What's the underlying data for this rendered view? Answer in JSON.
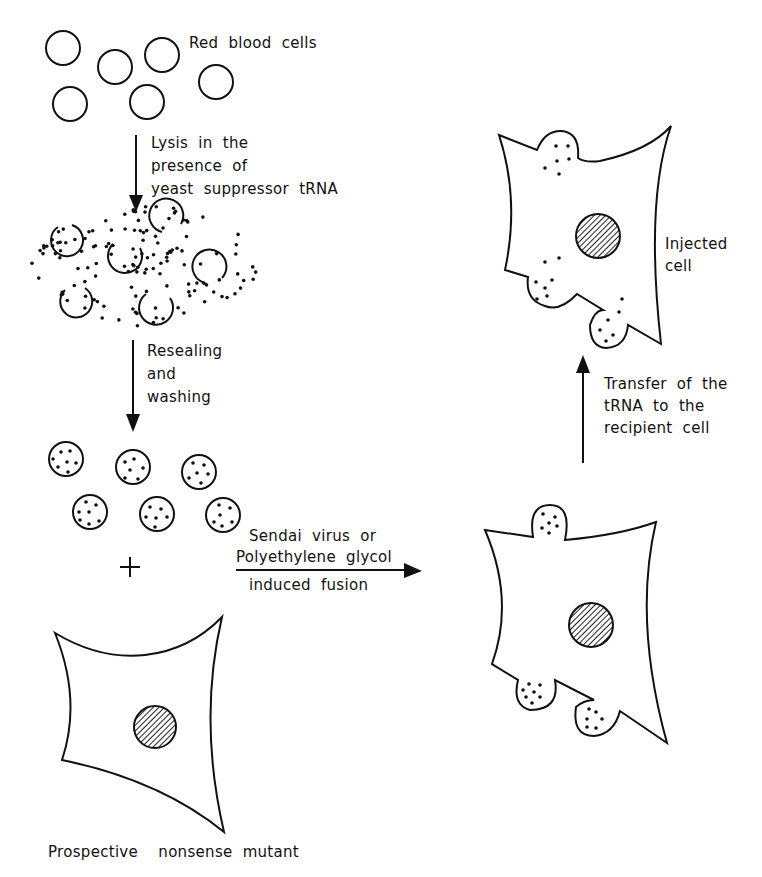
{
  "diagram": {
    "labels": {
      "red_blood_cells": "Red  blood  cells",
      "lysis": [
        "Lysis  in  the",
        "presence  of",
        "yeast  suppressor  tRNA"
      ],
      "resealing": [
        "Resealing",
        "and",
        "washing"
      ],
      "fusion": [
        "Sendai  virus  or",
        "Polyethylene  glycol",
        "induced  fusion"
      ],
      "transfer": [
        "Transfer  of  the",
        "tRNA  to  the",
        "recipient  cell"
      ],
      "injected_cell": [
        "Injected",
        "cell"
      ],
      "mutant": "Prospective    nonsense  mutant",
      "plus": "+"
    },
    "stages": [
      {
        "id": "red-blood-cells",
        "count": 7
      },
      {
        "id": "lysed-cells-with-trna",
        "count": 6
      },
      {
        "id": "resealed-loaded-ghosts",
        "count": 6
      },
      {
        "id": "recipient-cell",
        "count": 1
      },
      {
        "id": "fused-cell",
        "count": 1
      },
      {
        "id": "injected-cell",
        "count": 1
      }
    ],
    "colors": {
      "ink": "#111111",
      "background": "#ffffff"
    }
  }
}
